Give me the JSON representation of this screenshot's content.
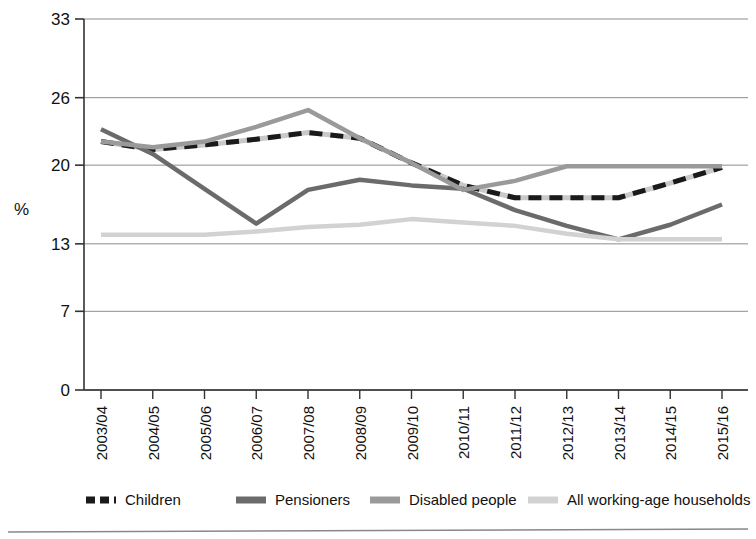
{
  "chart_data": {
    "type": "line",
    "title": "",
    "xlabel": "",
    "ylabel": "%",
    "ylim": [
      0,
      33
    ],
    "yticks": [
      0,
      7,
      13,
      20,
      26,
      33
    ],
    "grid": true,
    "legend_position": "bottom",
    "categories": [
      "2003/04",
      "2004/05",
      "2005/06",
      "2006/07",
      "2007/08",
      "2008/09",
      "2009/10",
      "2010/11",
      "2011/12",
      "2012/13",
      "2013/14",
      "2014/15",
      "2015/16"
    ],
    "series": [
      {
        "name": "Children",
        "color": "#1a1a1a",
        "style": "dashed",
        "values": [
          22.1,
          21.4,
          21.8,
          22.3,
          22.9,
          22.4,
          20.2,
          18.2,
          17.1,
          17.1,
          17.1,
          18.4,
          19.8
        ]
      },
      {
        "name": "Pensioners",
        "color": "#6b6b6b",
        "style": "solid",
        "values": [
          23.2,
          21.0,
          17.9,
          14.8,
          17.8,
          18.7,
          18.2,
          17.9,
          16.0,
          14.6,
          13.4,
          14.7,
          16.5
        ]
      },
      {
        "name": "Disabled people",
        "color": "#9a9a9a",
        "style": "solid",
        "values": [
          22.1,
          21.6,
          22.1,
          23.4,
          24.9,
          22.4,
          20.2,
          17.8,
          18.6,
          19.9,
          19.9,
          19.9,
          19.9
        ]
      },
      {
        "name": "All working-age households",
        "color": "#d2d2d2",
        "style": "solid",
        "values": [
          13.8,
          13.8,
          13.8,
          14.1,
          14.5,
          14.7,
          15.2,
          14.9,
          14.6,
          13.9,
          13.4,
          13.4,
          13.4
        ]
      }
    ]
  },
  "axis": {
    "y_title": "%"
  },
  "legend": {
    "items": [
      {
        "label": "Children"
      },
      {
        "label": "Pensioners"
      },
      {
        "label": "Disabled people"
      },
      {
        "label": "All working-age households"
      }
    ]
  }
}
